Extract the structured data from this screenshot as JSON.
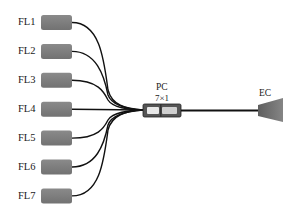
{
  "diagram": {
    "title": "",
    "fiber_lasers": [
      {
        "label": "FL1",
        "cy": 22.5
      },
      {
        "label": "FL2",
        "cy": 51.4
      },
      {
        "label": "FL3",
        "cy": 80.3
      },
      {
        "label": "FL4",
        "cy": 109.2
      },
      {
        "label": "FL5",
        "cy": 138.1
      },
      {
        "label": "FL6",
        "cy": 167.0
      },
      {
        "label": "FL7",
        "cy": 195.9
      }
    ],
    "combiner": {
      "label": "PC",
      "ratio": "7×1"
    },
    "end_cap": {
      "label": "EC"
    },
    "colors": {
      "laser_box": "#7a7a7a",
      "fiber": "#111111",
      "combiner_body": "#5a5a5a",
      "combiner_highlight": "#e6e6e6",
      "end_cap": "#6e6e6e",
      "text": "#1a1a1a"
    }
  }
}
